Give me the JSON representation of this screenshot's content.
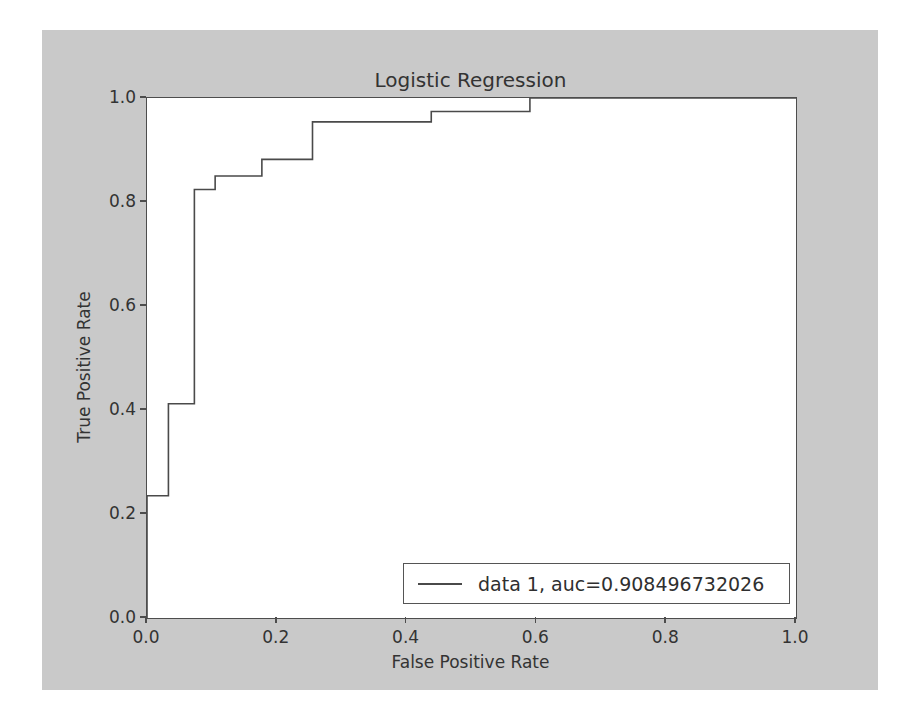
{
  "figure": {
    "background_color": "#c9c9c9",
    "plot_background_color": "#ffffff",
    "frame_color": "#4d4d4d"
  },
  "chart_data": {
    "type": "line",
    "title": "Logistic Regression",
    "xlabel": "False Positive Rate",
    "ylabel": "True Positive Rate",
    "xlim": [
      0.0,
      1.0
    ],
    "ylim": [
      0.0,
      1.0
    ],
    "grid": false,
    "legend_position": "lower right",
    "line_color": "#4a4a4a",
    "xticks": [
      0.0,
      0.2,
      0.4,
      0.6,
      0.8,
      1.0
    ],
    "xticklabels": [
      "0.0",
      "0.2",
      "0.4",
      "0.6",
      "0.8",
      "1.0"
    ],
    "yticks": [
      0.0,
      0.2,
      0.4,
      0.6,
      0.8,
      1.0
    ],
    "yticklabels": [
      "0.0",
      "0.2",
      "0.4",
      "0.6",
      "0.8",
      "1.0"
    ],
    "series": [
      {
        "name": "data 1, auc=0.908496732026",
        "auc": 0.908496732026,
        "drawstyle": "steps-post",
        "x": [
          0.0,
          0.0,
          0.033,
          0.033,
          0.073,
          0.073,
          0.105,
          0.105,
          0.177,
          0.177,
          0.255,
          0.255,
          0.438,
          0.438,
          0.59,
          0.59,
          1.0
        ],
        "y": [
          0.0,
          0.235,
          0.235,
          0.412,
          0.412,
          0.824,
          0.824,
          0.85,
          0.85,
          0.882,
          0.882,
          0.954,
          0.954,
          0.974,
          0.974,
          1.0,
          1.0
        ]
      }
    ]
  },
  "legend": {
    "entries": [
      {
        "label": "data 1, auc=0.908496732026"
      }
    ]
  }
}
